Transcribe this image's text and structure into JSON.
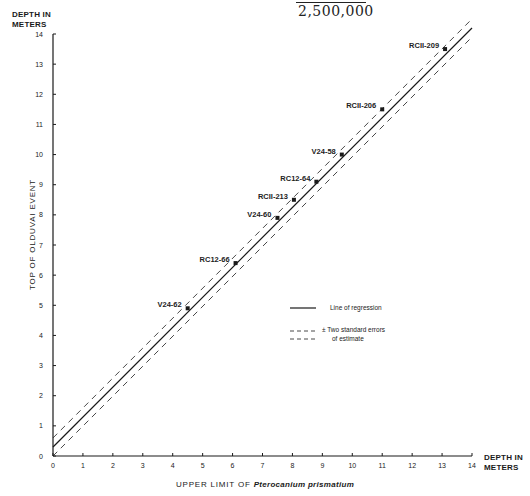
{
  "header": {
    "fraction_denominator": "2,500,000"
  },
  "axes": {
    "y_unit_label": [
      "DEPTH IN",
      "METERS"
    ],
    "x_unit_label": [
      "DEPTH IN",
      "METERS"
    ],
    "y_title": "TOP OF OLDUVAI EVENT",
    "x_title_prefix": "UPPER LIMIT OF ",
    "x_title_species": "Pterocanium prismatium"
  },
  "legend": {
    "regression_label": "Line of regression",
    "error_label_line1": "± Two standard errors",
    "error_label_line2": "of estimate"
  },
  "chart_data": {
    "type": "scatter",
    "title": "",
    "xlabel": "UPPER LIMIT OF Pterocanium prismatium (DEPTH IN METERS)",
    "ylabel": "TOP OF OLDUVAI EVENT (DEPTH IN METERS)",
    "xlim": [
      0,
      14
    ],
    "ylim": [
      0,
      14
    ],
    "x_ticks": [
      0,
      1,
      2,
      3,
      4,
      5,
      6,
      7,
      8,
      9,
      10,
      11,
      12,
      13,
      14
    ],
    "y_ticks": [
      0,
      1,
      2,
      3,
      4,
      5,
      6,
      7,
      8,
      9,
      10,
      11,
      12,
      13,
      14
    ],
    "grid": false,
    "legend_position": "lower right (inside plot)",
    "points": [
      {
        "label": "V24-62",
        "x": 4.5,
        "y": 4.9
      },
      {
        "label": "RC12-66",
        "x": 6.1,
        "y": 6.4
      },
      {
        "label": "V24-60",
        "x": 7.5,
        "y": 7.9
      },
      {
        "label": "RCII-213",
        "x": 8.05,
        "y": 8.5
      },
      {
        "label": "RC12-64",
        "x": 8.8,
        "y": 9.1
      },
      {
        "label": "V24-58",
        "x": 9.65,
        "y": 10.0
      },
      {
        "label": "RCII-206",
        "x": 11.0,
        "y": 11.5
      },
      {
        "label": "RCII-209",
        "x": 13.1,
        "y": 13.5
      }
    ],
    "series": [
      {
        "name": "Line of regression",
        "style": "solid",
        "x": [
          0,
          14
        ],
        "y": [
          0.3,
          14.2
        ]
      },
      {
        "name": "+ Two standard errors of estimate",
        "style": "dashed",
        "x": [
          0,
          14
        ],
        "y": [
          0.6,
          14.5
        ]
      },
      {
        "name": "- Two standard errors of estimate",
        "style": "dashed",
        "x": [
          0,
          14
        ],
        "y": [
          0.0,
          13.9
        ]
      }
    ]
  },
  "colors": {
    "ink": "#1a1a1a",
    "background": "#ffffff"
  }
}
